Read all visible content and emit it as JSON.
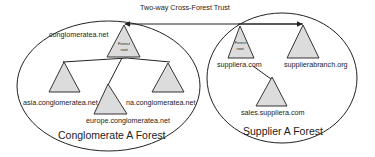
{
  "trust": {
    "label": "Two-way Cross-Forest Trust"
  },
  "forests": [
    {
      "name": "Conglomerate A Forest",
      "root_domain": "conglomeratea.net",
      "root_badge": [
        "Forest",
        "root"
      ],
      "children": [
        "asia.conglomeratea.net",
        "europe.conglomeratea.net",
        "na.conglomeratea.net"
      ]
    },
    {
      "name": "Supplier A Forest",
      "root_domain": "suppliera.com",
      "root_badge": [
        "Forest",
        "root"
      ],
      "children": [
        "sales.suppliera.com"
      ],
      "other_trees": [
        "supplierabranch.org"
      ]
    }
  ],
  "colors": {
    "triangle_fill": "#dcdcdc",
    "stroke": "#222222",
    "background": "#ffffff"
  }
}
